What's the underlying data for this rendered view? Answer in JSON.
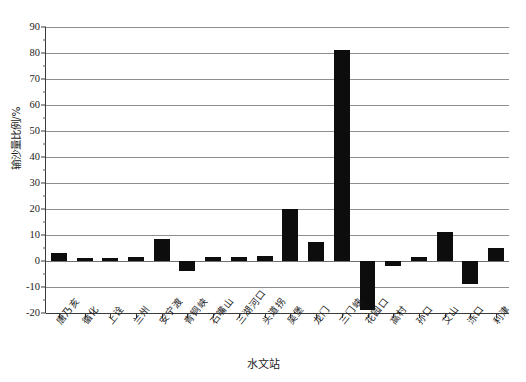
{
  "chart_data": {
    "type": "bar",
    "title": "",
    "xlabel": "水文站",
    "ylabel": "输沙量比例/%",
    "ylim": [
      -20,
      90
    ],
    "ytick_step": 10,
    "yticks": [
      90,
      80,
      70,
      60,
      50,
      40,
      30,
      20,
      10,
      0,
      -10,
      -20
    ],
    "ytick_labels": [
      "90",
      "80",
      "70",
      "60",
      "50",
      "40",
      "30",
      "20",
      "10",
      "0",
      "-10",
      "-20"
    ],
    "grid": true,
    "grid_axis": "y",
    "legend": "none",
    "bar_color": "#0d0d0d",
    "categories": [
      "唐乃亥",
      "循化",
      "上诠",
      "兰州",
      "安宁渡",
      "青铜峡",
      "石嘴山",
      "三湖河口",
      "头道拐",
      "吴堡",
      "龙门",
      "三门峡",
      "花园口",
      "高村",
      "孙口",
      "艾山",
      "泺口",
      "利津"
    ],
    "values": [
      3,
      1,
      1,
      1.5,
      8.5,
      -4,
      1.5,
      1.5,
      2,
      20,
      7.5,
      81,
      -19,
      -2,
      1.5,
      11,
      -9,
      5
    ]
  }
}
